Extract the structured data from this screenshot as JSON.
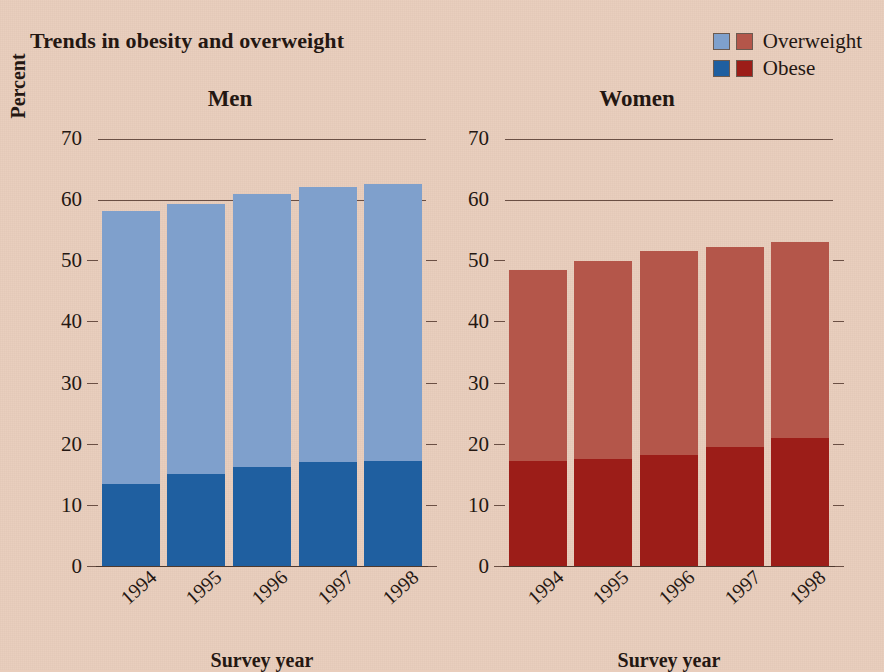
{
  "title": "Trends in obesity and overweight",
  "legend": {
    "items": [
      {
        "label": "Overweight",
        "swatch_men": "#7fa0cc",
        "swatch_women": "#b4564a"
      },
      {
        "label": "Obese",
        "swatch_men": "#1f5fa0",
        "swatch_women": "#9c1d18"
      }
    ]
  },
  "axis": {
    "ylabel": "Percent",
    "xlabel": "Survey year",
    "yticks": [
      70,
      60,
      50,
      40,
      30,
      20,
      10,
      0
    ],
    "xticks": [
      "1994",
      "1995",
      "1996",
      "1997",
      "1998"
    ]
  },
  "panels": [
    {
      "name": "Men",
      "xlabel": "Survey year"
    },
    {
      "name": "Women",
      "xlabel": "Survey year"
    }
  ],
  "colors": {
    "background": "#e9cdbc",
    "text": "#241712",
    "axis": "#6a4f44",
    "men_overweight": "#7fa0cc",
    "men_obese": "#1f5fa0",
    "women_overweight": "#b4564a",
    "women_obese": "#9c1d18"
  },
  "chart_data": {
    "type": "bar",
    "stacked": true,
    "title": "Trends in obesity and overweight",
    "xlabel": "Survey year",
    "ylabel": "Percent",
    "ylim": [
      0,
      70
    ],
    "ytick_step": 10,
    "grid": "horizontal",
    "legend_position": "top-right",
    "categories": [
      "1994",
      "1995",
      "1996",
      "1997",
      "1998"
    ],
    "panels": [
      {
        "name": "Men",
        "series": [
          {
            "name": "Obese",
            "values": [
              13.5,
              15.2,
              16.4,
              17.1,
              17.3
            ],
            "color": "#1f5fa0"
          },
          {
            "name": "Overweight",
            "values": [
              58.3,
              59.4,
              61.0,
              62.1,
              62.6
            ],
            "color": "#7fa0cc",
            "note": "cumulative total height including obese"
          }
        ]
      },
      {
        "name": "Women",
        "series": [
          {
            "name": "Obese",
            "values": [
              17.3,
              17.6,
              18.3,
              19.6,
              21.1
            ],
            "color": "#9c1d18"
          },
          {
            "name": "Overweight",
            "values": [
              48.6,
              50.1,
              51.7,
              52.4,
              53.2
            ],
            "color": "#b4564a",
            "note": "cumulative total height including obese"
          }
        ]
      }
    ]
  }
}
